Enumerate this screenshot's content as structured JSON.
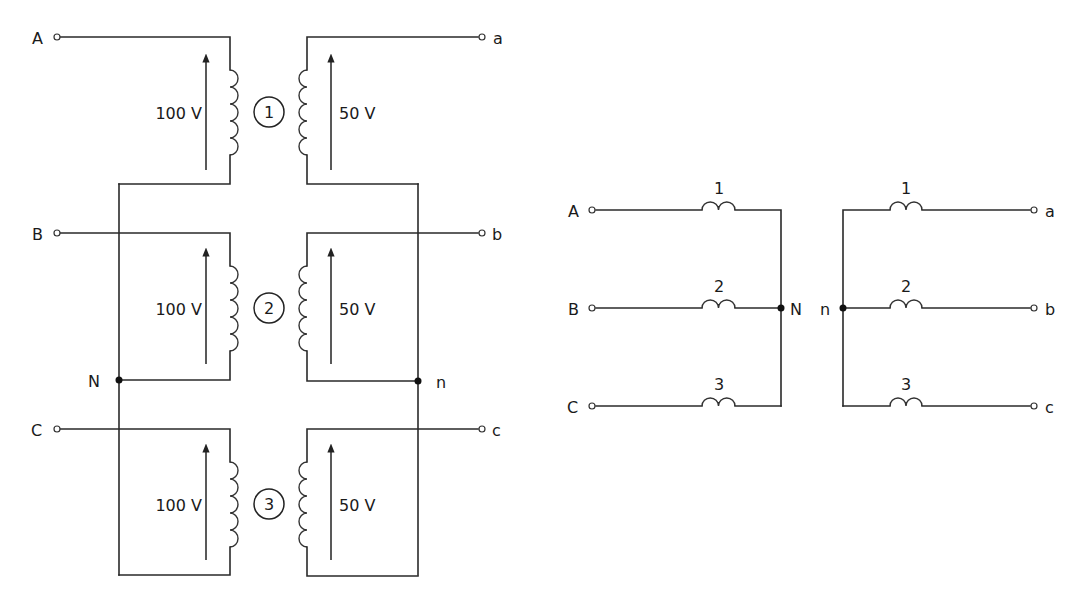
{
  "left_diagram": {
    "title": "Three single-phase transformers wired in wye-wye",
    "primary_terminals": [
      "A",
      "B",
      "C"
    ],
    "secondary_terminals": [
      "a",
      "b",
      "c"
    ],
    "neutral_primary": "N",
    "neutral_secondary": "n",
    "units": [
      {
        "id": "1",
        "primary_voltage": "100 V",
        "secondary_voltage": "50 V"
      },
      {
        "id": "2",
        "primary_voltage": "100 V",
        "secondary_voltage": "50 V"
      },
      {
        "id": "3",
        "primary_voltage": "100 V",
        "secondary_voltage": "50 V"
      }
    ]
  },
  "right_diagram": {
    "title": "Equivalent wye-wye schematic",
    "primary": {
      "terminals": [
        "A",
        "B",
        "C"
      ],
      "winding_labels": [
        "1",
        "2",
        "3"
      ],
      "neutral": "N"
    },
    "secondary": {
      "terminals": [
        "a",
        "b",
        "c"
      ],
      "winding_labels": [
        "1",
        "2",
        "3"
      ],
      "neutral": "n"
    }
  },
  "colors": {
    "wire": "#2a2a2a",
    "background": "#ffffff"
  }
}
